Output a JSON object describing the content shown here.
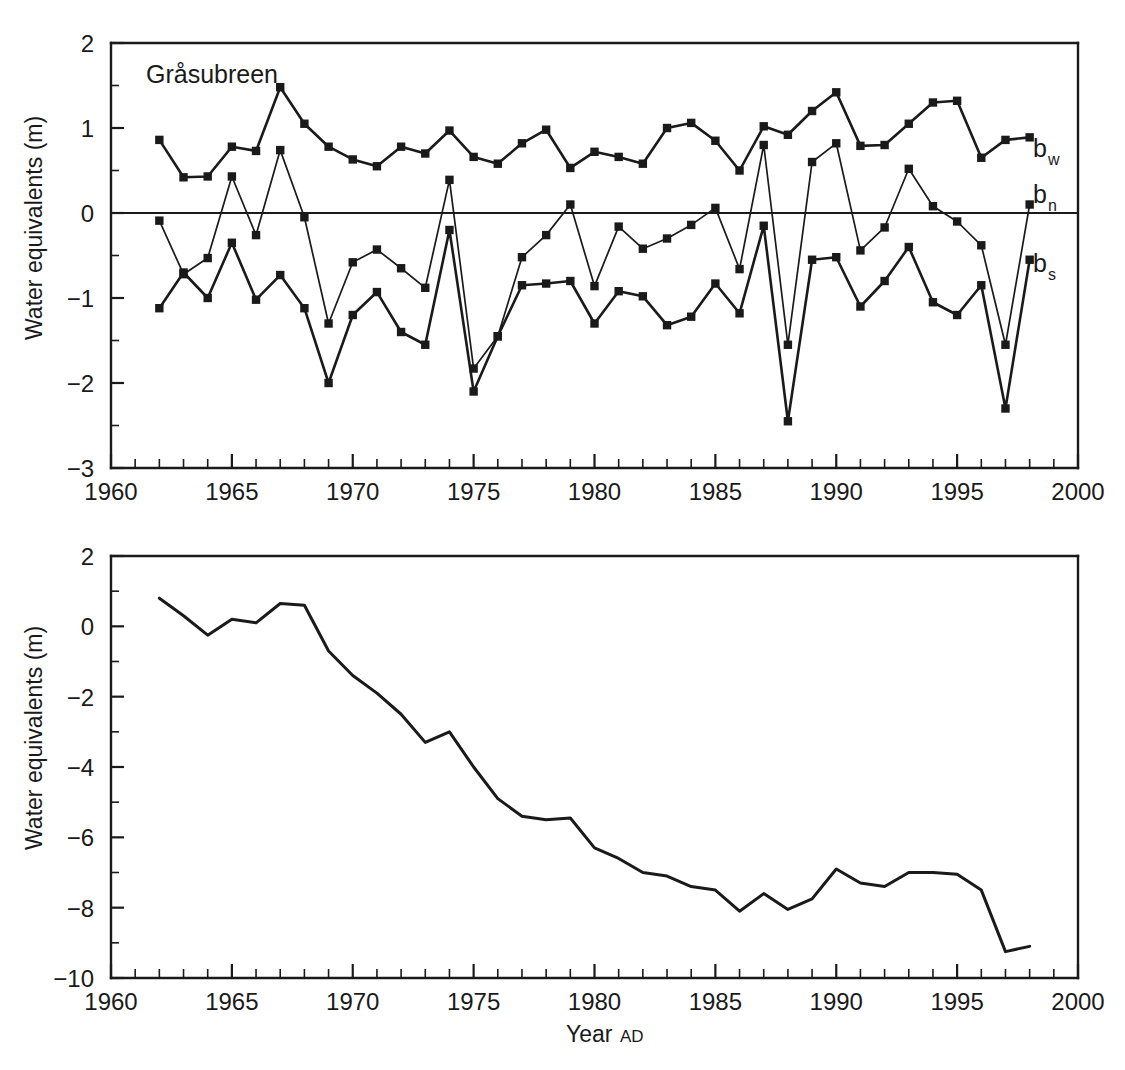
{
  "figure": {
    "background": "#ffffff",
    "ink_color": "#1a1a1a"
  },
  "chart_data": [
    {
      "id": "annual-mass-balance",
      "type": "line",
      "title": "Gråsubreen",
      "xlabel": "",
      "ylabel": "Water equivalents (m)",
      "xlim": [
        1960,
        2000
      ],
      "ylim": [
        -3,
        2
      ],
      "grid": false,
      "legend_position": "right-inline",
      "x_major_ticks": [
        1960,
        1965,
        1970,
        1975,
        1980,
        1985,
        1990,
        1995,
        2000
      ],
      "x_tick_labels": [
        "1960",
        "1965",
        "1970",
        "1975",
        "1980",
        "1985",
        "1990",
        "1995",
        "2000"
      ],
      "x_minor_step": 1,
      "y_major_ticks": [
        2,
        1,
        0,
        -1,
        -2,
        -3
      ],
      "y_tick_labels": [
        "2",
        "1",
        "0",
        "−1",
        "−2",
        "−3"
      ],
      "y_minor_step": 0.5,
      "zero_line": 0,
      "markers": "square",
      "x": [
        1962,
        1963,
        1964,
        1965,
        1966,
        1967,
        1968,
        1969,
        1970,
        1971,
        1972,
        1973,
        1974,
        1975,
        1976,
        1977,
        1978,
        1979,
        1980,
        1981,
        1982,
        1983,
        1984,
        1985,
        1986,
        1987,
        1988,
        1989,
        1990,
        1991,
        1992,
        1993,
        1994,
        1995,
        1996,
        1997,
        1998
      ],
      "series": [
        {
          "name": "b_w",
          "label": "b",
          "label_sub": "w",
          "description": "winter balance",
          "values": [
            0.86,
            0.42,
            0.43,
            0.78,
            0.73,
            1.48,
            1.05,
            0.78,
            0.63,
            0.55,
            0.78,
            0.7,
            0.97,
            0.66,
            0.58,
            0.82,
            0.98,
            0.53,
            0.72,
            0.66,
            0.58,
            1.0,
            1.06,
            0.85,
            0.5,
            1.02,
            0.92,
            1.2,
            1.42,
            0.79,
            0.8,
            1.05,
            1.3,
            1.32,
            0.65,
            0.86,
            0.89
          ]
        },
        {
          "name": "b_n",
          "label": "b",
          "label_sub": "n",
          "description": "net balance",
          "values": [
            -0.09,
            -0.72,
            -0.53,
            0.43,
            -0.26,
            0.74,
            -0.05,
            -1.3,
            -0.58,
            -0.43,
            -0.65,
            -0.88,
            0.39,
            -1.83,
            -1.45,
            -0.52,
            -0.26,
            0.1,
            -0.86,
            -0.16,
            -0.42,
            -0.3,
            -0.14,
            0.06,
            -0.66,
            0.8,
            -1.55,
            0.6,
            0.82,
            -0.44,
            -0.17,
            0.52,
            0.08,
            -0.1,
            -0.38,
            -1.55,
            0.1
          ]
        },
        {
          "name": "b_s",
          "label": "b",
          "label_sub": "s",
          "description": "summer balance",
          "values": [
            -1.12,
            -0.7,
            -1.0,
            -0.35,
            -1.02,
            -0.73,
            -1.12,
            -2.0,
            -1.2,
            -0.93,
            -1.4,
            -1.55,
            -0.2,
            -2.1,
            -1.45,
            -0.85,
            -0.83,
            -0.8,
            -1.3,
            -0.92,
            -0.98,
            -1.32,
            -1.22,
            -0.83,
            -1.18,
            -0.15,
            -2.45,
            -0.55,
            -0.52,
            -1.1,
            -0.8,
            -0.4,
            -1.05,
            -1.2,
            -0.85,
            -2.3,
            -0.55
          ]
        }
      ]
    },
    {
      "id": "cumulative-mass-balance",
      "type": "line",
      "title": "",
      "xlabel": "Year AD",
      "xlabel_main": "Year",
      "xlabel_small": "AD",
      "ylabel": "Water equivalents (m)",
      "xlim": [
        1960,
        2000
      ],
      "ylim": [
        -10,
        2
      ],
      "grid": false,
      "x_major_ticks": [
        1960,
        1965,
        1970,
        1975,
        1980,
        1985,
        1990,
        1995,
        2000
      ],
      "x_tick_labels": [
        "1960",
        "1965",
        "1970",
        "1975",
        "1980",
        "1985",
        "1990",
        "1995",
        "2000"
      ],
      "x_minor_step": 1,
      "y_major_ticks": [
        2,
        0,
        -2,
        -4,
        -6,
        -8,
        -10
      ],
      "y_tick_labels": [
        "2",
        "0",
        "−2",
        "−4",
        "−6",
        "−8",
        "−10"
      ],
      "y_minor_step": 1,
      "markers": "none",
      "x": [
        1962,
        1963,
        1964,
        1965,
        1966,
        1967,
        1968,
        1969,
        1970,
        1971,
        1972,
        1973,
        1974,
        1975,
        1976,
        1977,
        1978,
        1979,
        1980,
        1981,
        1982,
        1983,
        1984,
        1985,
        1986,
        1987,
        1988,
        1989,
        1990,
        1991,
        1992,
        1993,
        1994,
        1995,
        1996,
        1997,
        1998
      ],
      "series": [
        {
          "name": "cumulative_net_balance",
          "description": "Cumulative net mass balance",
          "values": [
            0.8,
            0.3,
            -0.25,
            0.2,
            0.1,
            0.65,
            0.6,
            -0.7,
            -1.4,
            -1.9,
            -2.5,
            -3.3,
            -3.0,
            -4.0,
            -4.9,
            -5.4,
            -5.5,
            -5.45,
            -6.3,
            -6.6,
            -7.0,
            -7.1,
            -7.4,
            -7.5,
            -8.1,
            -7.6,
            -8.05,
            -7.75,
            -6.9,
            -7.3,
            -7.4,
            -7.0,
            -7.0,
            -7.05,
            -7.5,
            -9.25,
            -9.1
          ]
        }
      ]
    }
  ]
}
